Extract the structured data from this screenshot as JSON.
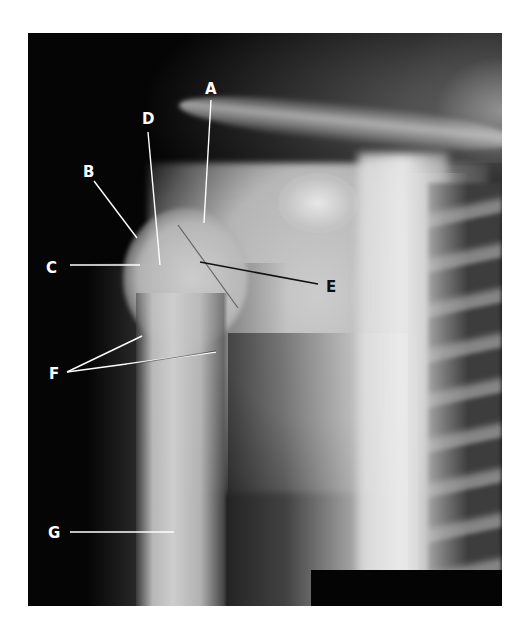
{
  "figure": {
    "type": "radiograph",
    "colors": {
      "background": "#ffffff",
      "film_dark": "#050505",
      "label_light": "#ffffff",
      "label_dark": "#111111"
    }
  },
  "labels": [
    {
      "id": "A",
      "text": "A",
      "x": 205,
      "y": 82,
      "tone": "light",
      "line": {
        "x1": 211,
        "y1": 100,
        "x2": 204,
        "y2": 223
      }
    },
    {
      "id": "B",
      "text": "B",
      "x": 83,
      "y": 165,
      "tone": "light",
      "line": {
        "x1": 94,
        "y1": 181,
        "x2": 137,
        "y2": 238
      }
    },
    {
      "id": "C",
      "text": "C",
      "x": 46,
      "y": 261,
      "tone": "light",
      "line": {
        "x1": 70,
        "y1": 265,
        "x2": 140,
        "y2": 265
      }
    },
    {
      "id": "D",
      "text": "D",
      "x": 142,
      "y": 112,
      "tone": "light",
      "line": {
        "x1": 148,
        "y1": 132,
        "x2": 160,
        "y2": 265
      }
    },
    {
      "id": "E",
      "text": "E",
      "x": 326,
      "y": 280,
      "tone": "dark",
      "line": {
        "x1": 200,
        "y1": 262,
        "x2": 318,
        "y2": 284
      }
    },
    {
      "id": "F",
      "text": "F",
      "x": 49,
      "y": 367,
      "tone": "light",
      "lines": [
        {
          "x1": 67,
          "y1": 372,
          "x2": 142,
          "y2": 336
        },
        {
          "x1": 67,
          "y1": 372,
          "x2": 216,
          "y2": 352
        }
      ]
    },
    {
      "id": "G",
      "text": "G",
      "x": 48,
      "y": 526,
      "tone": "light",
      "line": {
        "x1": 70,
        "y1": 532,
        "x2": 174,
        "y2": 532
      }
    }
  ]
}
